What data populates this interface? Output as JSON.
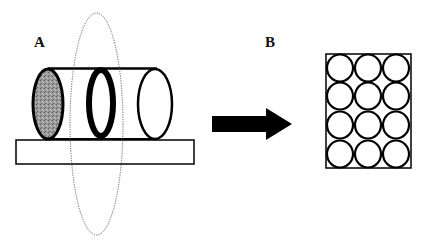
{
  "panels": [
    {
      "label": "A",
      "description": "Cylinder lying on a platform with a shaded left end cap, a thick ring in the middle, and an open right end; a dotted vertical ellipse passes through the cylinder"
    },
    {
      "label": "B",
      "description": "Rectangle packed with a 3 by 4 grid of circles"
    }
  ],
  "arrow": {
    "direction": "right",
    "color": "#000000"
  },
  "grid": {
    "columns": 3,
    "rows": 4
  },
  "colors": {
    "stroke": "#000000",
    "shade": "#8a8a8a",
    "dotted": "#555555",
    "background": "#ffffff"
  }
}
